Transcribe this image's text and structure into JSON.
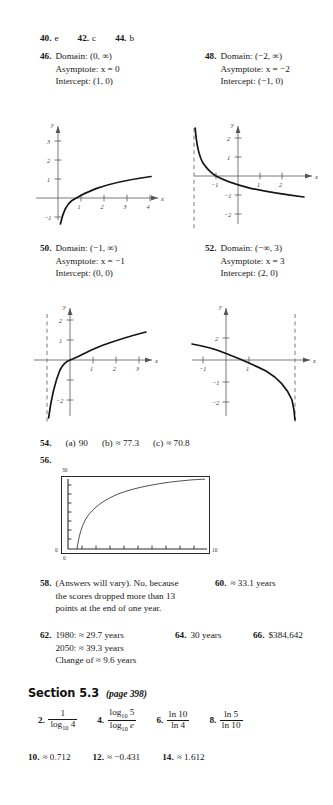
{
  "page": {
    "type": "textbook-answer-key",
    "width": 333,
    "height": 805
  },
  "row_40": {
    "items": [
      {
        "number": "40.",
        "answer": "e"
      },
      {
        "number": "42.",
        "answer": "c"
      },
      {
        "number": "44.",
        "answer": "b"
      }
    ]
  },
  "problem_46": {
    "number": "46.",
    "lines": [
      "Domain: (0, ∞)",
      "Asymptote: x = 0",
      "Intercept: (1, 0)"
    ]
  },
  "problem_48": {
    "number": "48.",
    "lines": [
      "Domain: (−2, ∞)",
      "Asymptote: x = −2",
      "Intercept: (−1, 0)"
    ]
  },
  "problem_50": {
    "number": "50.",
    "lines": [
      "Domain: (−1, ∞)",
      "Asymptote: x = −1",
      "Intercept: (0, 0)"
    ]
  },
  "problem_52": {
    "number": "52.",
    "lines": [
      "Domain: (−∞, 3)",
      "Asymptote: x = 3",
      "Intercept: (2, 0)"
    ]
  },
  "row_54": {
    "number": "54.",
    "parts": [
      {
        "label": "(a)",
        "value": "90"
      },
      {
        "label": "(b)",
        "value": "≈ 77.3"
      },
      {
        "label": "(c)",
        "value": "≈ 70.8"
      }
    ]
  },
  "problem_56": {
    "number": "56.",
    "calculator": {
      "y_max": "30",
      "y_min": "0",
      "x_min": "0",
      "x_max": "10"
    }
  },
  "problem_58": {
    "number": "58.",
    "lines": [
      "(Answers will vary). No, because",
      "the scores dropped more than 13",
      "points at the end of one year."
    ]
  },
  "problem_60": {
    "number": "60.",
    "answer": "≈ 33.1 years"
  },
  "problem_62": {
    "number": "62.",
    "lines": [
      "1980: ≈ 29.7 years",
      "2050: ≈ 39.3 years",
      "Change of ≈ 9.6 years"
    ]
  },
  "problem_64": {
    "number": "64.",
    "answer": "30 years"
  },
  "problem_66": {
    "number": "66.",
    "answer": "$384,642"
  },
  "section": {
    "title": "Section 5.3",
    "page_ref": "(page 398)"
  },
  "fraction_answers": [
    {
      "number": "2.",
      "numerator": "1",
      "num_base": "",
      "num_sub": "",
      "num_arg": "",
      "denominator_base": "log",
      "denominator_sub": "10",
      "denominator_arg": "4"
    },
    {
      "number": "4.",
      "numerator_base": "log",
      "num_sub": "10",
      "num_arg": "5",
      "denominator_base": "log",
      "denominator_sub": "10",
      "denominator_arg": "e"
    },
    {
      "number": "6.",
      "numerator": "ln 10",
      "denominator": "ln 4"
    },
    {
      "number": "8.",
      "numerator": "ln 5",
      "denominator": "ln 10"
    }
  ],
  "row_10": {
    "items": [
      {
        "number": "10.",
        "answer": "≈ 0.712"
      },
      {
        "number": "12.",
        "answer": "≈ −0.431"
      },
      {
        "number": "14.",
        "answer": "≈ 1.612"
      }
    ]
  },
  "graphs": {
    "g46": {
      "type": "line",
      "function": "y = ln x",
      "xlabel": "x",
      "ylabel": "y",
      "x_ticks": [
        "1",
        "2",
        "3",
        "4"
      ],
      "y_ticks": [
        "1",
        "2",
        "3",
        "-1"
      ],
      "xlim": [
        -0.6,
        4.8
      ],
      "ylim": [
        -1.4,
        3.6
      ],
      "asymptote": "x = 0",
      "asymptote_dashed": false,
      "intercept": [
        1,
        0
      ]
    },
    "g48": {
      "type": "line",
      "function": "y = -ln(x + 2)",
      "xlabel": "x",
      "ylabel": "y",
      "x_ticks": [
        "-1",
        "1",
        "2"
      ],
      "y_ticks": [
        "1",
        "2",
        "-1",
        "-2"
      ],
      "xlim": [
        -2.6,
        2.8
      ],
      "ylim": [
        -2.4,
        2.6
      ],
      "asymptote": "x = -2",
      "asymptote_dashed": true,
      "intercept": [
        -1,
        0
      ]
    },
    "g50": {
      "type": "line",
      "function": "y = ln(x + 1)",
      "xlabel": "x",
      "ylabel": "y",
      "x_ticks": [
        "1",
        "2",
        "3"
      ],
      "y_ticks": [
        "1",
        "2",
        "-2"
      ],
      "xlim": [
        -1.6,
        3.8
      ],
      "ylim": [
        -2.4,
        2.4
      ],
      "asymptote": "x = -1",
      "asymptote_dashed": true,
      "intercept": [
        0,
        0
      ]
    },
    "g52": {
      "type": "line",
      "function": "y = ln(3 - x)",
      "xlabel": "x",
      "ylabel": "y",
      "x_ticks": [
        "-1",
        "1"
      ],
      "y_ticks": [
        "2",
        "-1",
        "-2"
      ],
      "xlim": [
        -2.0,
        4.2
      ],
      "ylim": [
        -2.4,
        2.6
      ],
      "asymptote": "x = 3",
      "asymptote_dashed": true,
      "intercept": [
        2,
        0
      ]
    },
    "g56": {
      "type": "line",
      "function": "logarithmic growth curve",
      "xlim": [
        0,
        10
      ],
      "ylim": [
        0,
        30
      ]
    }
  }
}
